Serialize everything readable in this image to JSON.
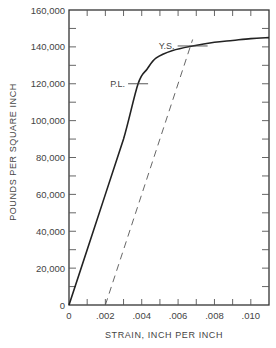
{
  "chart_data": {
    "type": "line",
    "title": "",
    "xlabel": "STRAIN, INCH PER INCH",
    "ylabel": "POUNDS PER SQUARE INCH",
    "xlim": [
      0,
      0.011
    ],
    "ylim": [
      0,
      160000
    ],
    "x_ticks": [
      0,
      0.002,
      0.004,
      0.006,
      0.008,
      0.01
    ],
    "x_tick_labels": [
      "0",
      ".002",
      ".004",
      ".006",
      ".008",
      ".010"
    ],
    "x_minor_step": 0.001,
    "y_ticks": [
      0,
      20000,
      40000,
      60000,
      80000,
      100000,
      120000,
      140000,
      160000
    ],
    "y_tick_labels": [
      "0",
      "20,000",
      "40,000",
      "60,000",
      "80,000",
      "100,000",
      "120,000",
      "140,000",
      "160,000"
    ],
    "y_minor_step": 10000,
    "grid": false,
    "legend": null,
    "series": [
      {
        "name": "stress-strain curve",
        "style": "solid",
        "color": "#222222",
        "x": [
          0,
          0.001,
          0.002,
          0.003,
          0.0038,
          0.0043,
          0.0048,
          0.0057,
          0.0068,
          0.008,
          0.009,
          0.01,
          0.011
        ],
        "y": [
          0,
          30000,
          60000,
          90000,
          120000,
          128000,
          134000,
          138000,
          140500,
          142500,
          143500,
          144500,
          145000
        ]
      },
      {
        "name": "0.2% offset line",
        "style": "dashed",
        "color": "#555555",
        "x": [
          0.002,
          0.0068
        ],
        "y": [
          0,
          144000
        ]
      }
    ],
    "annotations": [
      {
        "text": "P.L.",
        "meaning": "proportional limit",
        "x": 0.0038,
        "y": 120000
      },
      {
        "text": "Y.S.",
        "meaning": "yield strength",
        "x": 0.0068,
        "y": 140500
      }
    ]
  }
}
